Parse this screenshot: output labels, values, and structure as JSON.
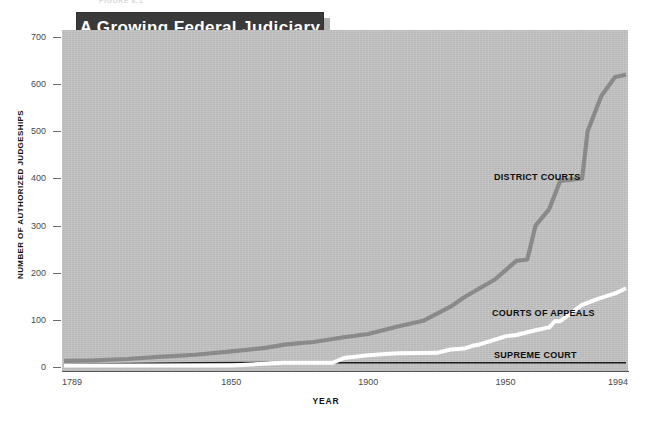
{
  "figure": {
    "caption_fragment": "FIGURE 8.1",
    "title": "A Growing Federal Judiciary"
  },
  "axes": {
    "y_title": "NUMBER OF AUTHORIZED JUDGESHIPS",
    "x_title": "YEAR",
    "y_ticks": [
      "0",
      "100",
      "200",
      "300",
      "400",
      "500",
      "600",
      "700"
    ],
    "x_ticks": [
      "1789",
      "1850",
      "1900",
      "1950",
      "1994"
    ]
  },
  "series_labels": {
    "district": "DISTRICT COURTS",
    "appeals": "COURTS OF APPEALS",
    "supreme": "SUPREME COURT"
  },
  "colors": {
    "plot_background": "#c3c3c3",
    "banner_background": "#3a3a3a",
    "banner_text": "#ffffff",
    "district_courts": "#8a8a8a",
    "courts_of_appeals": "#ffffff",
    "supreme_court": "#1a1a1a",
    "axis": "#555555"
  },
  "chart_data": {
    "type": "line",
    "title": "A Growing Federal Judiciary",
    "xlabel": "YEAR",
    "ylabel": "NUMBER OF AUTHORIZED JUDGESHIPS",
    "xlim": [
      1789,
      1994
    ],
    "ylim": [
      0,
      700
    ],
    "grid": false,
    "legend": "inline-annotations",
    "xticks": [
      1789,
      1850,
      1900,
      1950,
      1994
    ],
    "yticks": [
      0,
      100,
      200,
      300,
      400,
      500,
      600,
      700
    ],
    "series": [
      {
        "name": "DISTRICT COURTS",
        "color": "#8a8a8a",
        "points": [
          [
            1789,
            13
          ],
          [
            1800,
            14
          ],
          [
            1812,
            17
          ],
          [
            1825,
            22
          ],
          [
            1837,
            26
          ],
          [
            1850,
            33
          ],
          [
            1863,
            41
          ],
          [
            1870,
            48
          ],
          [
            1880,
            53
          ],
          [
            1891,
            63
          ],
          [
            1900,
            70
          ],
          [
            1910,
            85
          ],
          [
            1920,
            98
          ],
          [
            1930,
            128
          ],
          [
            1935,
            148
          ],
          [
            1940,
            165
          ],
          [
            1946,
            185
          ],
          [
            1950,
            205
          ],
          [
            1954,
            225
          ],
          [
            1958,
            228
          ],
          [
            1961,
            300
          ],
          [
            1966,
            335
          ],
          [
            1970,
            395
          ],
          [
            1978,
            400
          ],
          [
            1980,
            500
          ],
          [
            1985,
            575
          ],
          [
            1990,
            615
          ],
          [
            1994,
            620
          ]
        ]
      },
      {
        "name": "COURTS OF APPEALS",
        "color": "#ffffff",
        "points": [
          [
            1789,
            3
          ],
          [
            1850,
            3
          ],
          [
            1869,
            9
          ],
          [
            1887,
            9
          ],
          [
            1891,
            19
          ],
          [
            1900,
            25
          ],
          [
            1905,
            27
          ],
          [
            1911,
            29
          ],
          [
            1925,
            30
          ],
          [
            1930,
            37
          ],
          [
            1935,
            39
          ],
          [
            1938,
            45
          ],
          [
            1940,
            47
          ],
          [
            1950,
            65
          ],
          [
            1954,
            68
          ],
          [
            1961,
            78
          ],
          [
            1966,
            84
          ],
          [
            1968,
            97
          ],
          [
            1970,
            97
          ],
          [
            1978,
            132
          ],
          [
            1984,
            145
          ],
          [
            1990,
            156
          ],
          [
            1994,
            167
          ]
        ]
      },
      {
        "name": "SUPREME COURT",
        "color": "#1a1a1a",
        "points": [
          [
            1789,
            6
          ],
          [
            1807,
            7
          ],
          [
            1837,
            9
          ],
          [
            1863,
            10
          ],
          [
            1866,
            8
          ],
          [
            1869,
            9
          ],
          [
            1994,
            9
          ]
        ]
      }
    ]
  }
}
